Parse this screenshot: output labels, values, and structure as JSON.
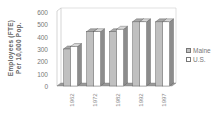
{
  "chart_data": {
    "type": "bar",
    "style": "3d-clustered-column",
    "title": "",
    "xlabel": "",
    "ylabel": "Employees (FTE) Per 10,000 Pop.",
    "ylabel_lines": [
      "Employees (FTE)",
      "Per 10,000 Pop."
    ],
    "categories": [
      "1962",
      "1972",
      "1982",
      "1992",
      "1997"
    ],
    "series": [
      {
        "name": "Maine",
        "color": "#c0c0c0",
        "values": [
          300,
          440,
          440,
          520,
          520
        ]
      },
      {
        "name": "U.S.",
        "color": "#ffffff",
        "values": [
          320,
          440,
          460,
          520,
          520
        ]
      }
    ],
    "ylim": [
      0,
      600
    ],
    "yticks": [
      "0",
      "100",
      "200",
      "300",
      "400",
      "500",
      "600"
    ],
    "grid": false,
    "legend_position": "right"
  },
  "legend": {
    "items": [
      {
        "label": "Maine",
        "color": "#c0c0c0"
      },
      {
        "label": "U.S.",
        "color": "#ffffff"
      }
    ]
  },
  "axis": {
    "ylabel_line1": "Employees (FTE)",
    "ylabel_line2": "Per 10,000 Pop."
  }
}
